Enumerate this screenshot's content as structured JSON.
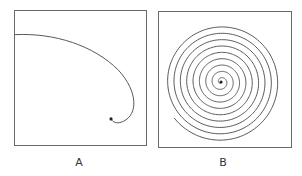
{
  "figure": {
    "panels": [
      {
        "id": "A",
        "label": "A",
        "description": "Single open spiral arc from top-left curving to a dot near center-right"
      },
      {
        "id": "B",
        "label": "B",
        "description": "Tightly wound Archimedean spiral with many turns ending at a center dot"
      }
    ],
    "colors": {
      "stroke": "#555555",
      "border": "#6a6a6a",
      "background": "#ffffff"
    }
  }
}
